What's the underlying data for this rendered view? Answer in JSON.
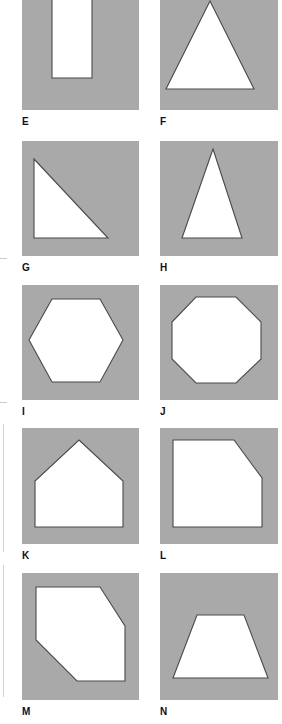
{
  "page": {
    "background_color": "#ffffff",
    "fill_color": "#a9a9a9",
    "shape_color": "#ffffff",
    "outline_color": "#4a4a4a",
    "label_color": "#101010",
    "width": 282,
    "height": 724,
    "columns": 2,
    "rows": 5
  },
  "figures": [
    {
      "label": "E",
      "shape_name": "rectangle",
      "description": "Upright white rectangle centred on a grey square",
      "column": 1,
      "row": 1,
      "panel": {
        "x": 22,
        "y": -8,
        "w": 117,
        "h": 118
      },
      "label_pos": {
        "x": 22,
        "y": 117
      },
      "points": "30,5 70,5 70,86 30,86"
    },
    {
      "label": "F",
      "shape_name": "triangle-equilateral",
      "description": "Wide white equilateral triangle pointing up",
      "column": 2,
      "row": 1,
      "panel": {
        "x": 160,
        "y": -8,
        "w": 118,
        "h": 118
      },
      "label_pos": {
        "x": 160,
        "y": 117
      },
      "points": "50,9 94,97 6,97"
    },
    {
      "label": "G",
      "shape_name": "right-triangle",
      "description": "White right triangle, right angle at lower left",
      "column": 1,
      "row": 2,
      "panel": {
        "x": 22,
        "y": 141,
        "w": 117,
        "h": 115
      },
      "label_pos": {
        "x": 22,
        "y": 263
      },
      "points": "12,18 12,97 86,97"
    },
    {
      "label": "H",
      "shape_name": "triangle-isosceles-narrow",
      "description": "Tall narrow white isosceles triangle pointing up",
      "column": 2,
      "row": 2,
      "panel": {
        "x": 160,
        "y": 141,
        "w": 118,
        "h": 115
      },
      "label_pos": {
        "x": 160,
        "y": 263
      },
      "points": "53,8 82,97 22,97"
    },
    {
      "label": "I",
      "shape_name": "hexagon",
      "description": "White regular hexagon with flat top and bottom, vertices left and right",
      "column": 1,
      "row": 3,
      "panel": {
        "x": 22,
        "y": 285,
        "w": 117,
        "h": 115
      },
      "label_pos": {
        "x": 22,
        "y": 407
      },
      "points": "30,14 78,14 101,55 78,97 30,97 7,55"
    },
    {
      "label": "J",
      "shape_name": "octagon",
      "description": "White regular octagon",
      "column": 2,
      "row": 3,
      "panel": {
        "x": 160,
        "y": 285,
        "w": 118,
        "h": 115
      },
      "label_pos": {
        "x": 160,
        "y": 407
      },
      "points": "36,12 76,12 101,37 101,74 76,98 36,98 12,74 12,37"
    },
    {
      "label": "K",
      "shape_name": "pentagon-house",
      "description": "White house-shaped pentagon with peaked roof",
      "column": 1,
      "row": 4,
      "panel": {
        "x": 22,
        "y": 428,
        "w": 117,
        "h": 116
      },
      "label_pos": {
        "x": 22,
        "y": 551
      },
      "points": "57,12 101,53 101,99 13,99 13,53"
    },
    {
      "label": "L",
      "shape_name": "square-cut-corner",
      "description": "White square with upper right corner bevelled off",
      "column": 2,
      "row": 4,
      "panel": {
        "x": 160,
        "y": 428,
        "w": 118,
        "h": 116
      },
      "label_pos": {
        "x": 160,
        "y": 551
      },
      "points": "13,12 74,12 102,50 102,99 13,99"
    },
    {
      "label": "M",
      "shape_name": "hexagon-irregular",
      "description": "White six-sided shape with upper right and lower left corners bevelled",
      "column": 1,
      "row": 5,
      "panel": {
        "x": 22,
        "y": 573,
        "w": 117,
        "h": 127
      },
      "label_pos": {
        "x": 22,
        "y": 707
      },
      "points": "14,14 78,14 103,53 103,108 55,108 14,67"
    },
    {
      "label": "N",
      "shape_name": "trapezoid",
      "description": "White isosceles trapezoid, shorter side at top",
      "column": 2,
      "row": 5,
      "panel": {
        "x": 160,
        "y": 573,
        "w": 118,
        "h": 127
      },
      "label_pos": {
        "x": 160,
        "y": 707
      },
      "points": "37,42 84,42 108,105 13,105"
    }
  ],
  "margin_marks": [
    {
      "type": "rule",
      "x": 3,
      "y": 424,
      "h": 128
    },
    {
      "type": "rule",
      "x": 3,
      "y": 565,
      "h": 132
    },
    {
      "type": "tick",
      "x": 0,
      "y": 258
    },
    {
      "type": "tick",
      "x": 0,
      "y": 402
    }
  ]
}
